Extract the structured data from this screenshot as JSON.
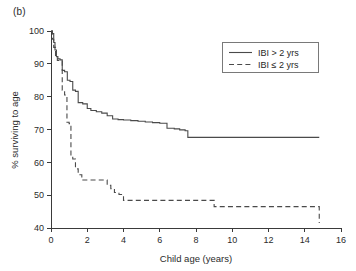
{
  "figure": {
    "panel_label": "(b)"
  },
  "chart_data": {
    "type": "line",
    "title": "",
    "subtitle": "",
    "xlabel": "Child age (years)",
    "ylabel": "% surviving to age",
    "xlim": [
      0,
      16
    ],
    "ylim": [
      40,
      100
    ],
    "xticks": [
      0,
      2,
      4,
      6,
      8,
      10,
      12,
      14,
      16
    ],
    "xtick_labels": [
      "0",
      "2",
      "4",
      "6",
      "8",
      "10",
      "12",
      "14",
      "16"
    ],
    "yticks": [
      40,
      50,
      60,
      70,
      80,
      90,
      100
    ],
    "ytick_labels": [
      "40",
      "50",
      "60",
      "70",
      "80",
      "90",
      "100"
    ],
    "grid": false,
    "legend_position": "top-right",
    "step_type": "post",
    "series": [
      {
        "name": "IBI > 2 yrs",
        "style": "solid",
        "color": "#4a4a4a",
        "x": [
          0.0,
          0.08,
          0.15,
          0.22,
          0.3,
          0.38,
          0.5,
          0.62,
          0.75,
          0.9,
          1.05,
          1.2,
          1.35,
          1.5,
          1.75,
          2.0,
          2.2,
          2.5,
          2.8,
          3.1,
          3.4,
          3.7,
          4.0,
          4.4,
          4.8,
          5.2,
          5.6,
          6.0,
          6.4,
          6.8,
          7.1,
          7.4,
          7.55,
          14.8
        ],
        "y": [
          100.0,
          99.2,
          96.5,
          94.2,
          92.2,
          91.5,
          91.2,
          88.0,
          87.6,
          85.0,
          84.6,
          82.0,
          81.6,
          78.2,
          77.8,
          76.4,
          75.8,
          75.4,
          75.0,
          74.2,
          73.2,
          73.0,
          72.9,
          72.7,
          72.5,
          72.3,
          72.1,
          71.9,
          70.4,
          70.2,
          69.9,
          69.6,
          67.6,
          67.6
        ]
      },
      {
        "name": "IBI ≤ 2 yrs",
        "style": "dashed",
        "color": "#4a4a4a",
        "x": [
          0.0,
          0.08,
          0.15,
          0.25,
          0.35,
          0.5,
          0.62,
          0.75,
          0.88,
          1.0,
          1.1,
          1.2,
          1.35,
          1.5,
          1.7,
          2.9,
          3.1,
          3.3,
          3.5,
          3.75,
          4.0,
          5.5,
          9.0,
          14.8
        ],
        "y": [
          100.0,
          97.5,
          95.0,
          92.0,
          91.0,
          90.8,
          82.0,
          80.5,
          72.2,
          71.8,
          61.5,
          61.0,
          58.0,
          56.2,
          54.6,
          54.6,
          53.0,
          52.0,
          50.8,
          50.2,
          48.4,
          48.4,
          46.5,
          41.5
        ]
      }
    ]
  }
}
